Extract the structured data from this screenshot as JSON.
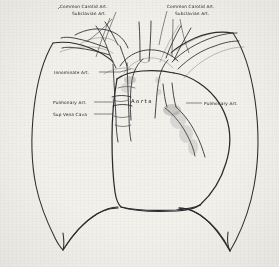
{
  "figure": {
    "medium": "hand-drawn pen-and-ink line diagram on aged paper",
    "background_color": "#f2f1ec",
    "ink_color": "#2b2b2e"
  },
  "labels": {
    "left_carotid": "Common Carotid Art.",
    "left_subclavian": "Subclavian Art.",
    "right_carotid": "Common Carotid Art.",
    "right_subclavian": "Subclavian Art.",
    "innominate": "Innominate Art.",
    "left_pulmonary": "Pulmonary Art.",
    "sup_vena_cava": "Sup Vena Cava",
    "right_pulmonary": "Pulmonary Art.",
    "aorta": "Aorta"
  },
  "structures": [
    {
      "name": "left-lung-outline",
      "kind": "lung"
    },
    {
      "name": "right-lung-outline",
      "kind": "lung"
    },
    {
      "name": "cardiac-silhouette",
      "kind": "heart"
    },
    {
      "name": "ascending-aorta",
      "kind": "vessel"
    },
    {
      "name": "aortic-arch",
      "kind": "vessel"
    },
    {
      "name": "innominate-artery",
      "kind": "vessel"
    },
    {
      "name": "left-common-carotid-artery",
      "kind": "vessel"
    },
    {
      "name": "left-subclavian-artery",
      "kind": "vessel"
    },
    {
      "name": "right-common-carotid-artery",
      "kind": "vessel"
    },
    {
      "name": "right-subclavian-artery",
      "kind": "vessel"
    },
    {
      "name": "superior-vena-cava",
      "kind": "vessel"
    },
    {
      "name": "left-pulmonary-artery",
      "kind": "vessel"
    },
    {
      "name": "right-pulmonary-artery",
      "kind": "vessel"
    },
    {
      "name": "trachea",
      "kind": "airway"
    },
    {
      "name": "diaphragm-left",
      "kind": "diaphragm"
    },
    {
      "name": "diaphragm-right",
      "kind": "diaphragm"
    }
  ]
}
